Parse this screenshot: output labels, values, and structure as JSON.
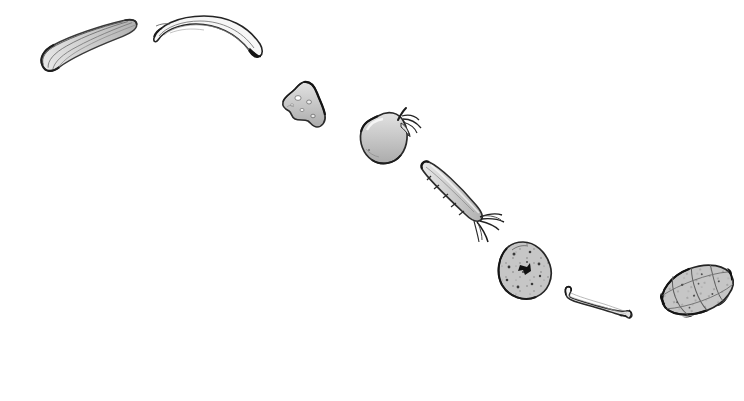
{
  "canvas": {
    "width": 744,
    "height": 401,
    "background_color": "#ffffff",
    "medium": "pen-and-ink line drawing with grey wash",
    "ink_color": "#2b2b2b",
    "wash_color": "#b9b9b9",
    "arrangement": "descending diagonal arc from upper-left to lower-right"
  },
  "items": [
    {
      "id": "zucchini",
      "label": "zucchini",
      "icon_name": "zucchini-icon",
      "order": 1,
      "x": 30,
      "y": 38,
      "width": 105,
      "height": 50,
      "rotation_deg": -13,
      "fill": "#d2d2d2",
      "stroke": "#333333",
      "notes": "elongated ridged squash, rounded blossom end at lower left"
    },
    {
      "id": "banana",
      "label": "banana",
      "icon_name": "banana-icon",
      "order": 2,
      "x": 150,
      "y": 14,
      "width": 115,
      "height": 52,
      "rotation_deg": 0,
      "fill": "#f2f2f2",
      "stroke": "#2b2b2b",
      "notes": "crescent curve, dark tip at lower right"
    },
    {
      "id": "cheese-wedge",
      "label": "cheese wedge",
      "icon_name": "cheese-wedge-icon",
      "order": 3,
      "x": 280,
      "y": 80,
      "width": 48,
      "height": 50,
      "rotation_deg": 0,
      "fill": "#cccccc",
      "stroke": "#2b2b2b",
      "notes": "triangular wedge with small round holes"
    },
    {
      "id": "apple",
      "label": "apple",
      "icon_name": "apple-icon",
      "order": 4,
      "x": 357,
      "y": 106,
      "width": 66,
      "height": 62,
      "rotation_deg": 0,
      "fill": "#c9c9c9",
      "stroke": "#2b2b2b",
      "notes": "rounded fruit with stem and leaf sprig at upper right"
    },
    {
      "id": "carrot",
      "label": "carrot",
      "icon_name": "carrot-icon",
      "order": 5,
      "x": 418,
      "y": 160,
      "width": 92,
      "height": 72,
      "rotation_deg": 0,
      "fill": "#c4c4c4",
      "stroke": "#2b2b2b",
      "notes": "tapered root pointing up-left with leafy greens at lower right"
    },
    {
      "id": "potato",
      "label": "potato",
      "icon_name": "potato-icon",
      "order": 6,
      "x": 496,
      "y": 240,
      "width": 60,
      "height": 60,
      "rotation_deg": 0,
      "fill": "#bdbdbd",
      "stroke": "#2b2b2b",
      "notes": "lumpy oval speckled with eyes, one solid dark eye near centre"
    },
    {
      "id": "bone",
      "label": "bone",
      "icon_name": "bone-icon",
      "order": 7,
      "x": 564,
      "y": 285,
      "width": 72,
      "height": 34,
      "rotation_deg": 0,
      "fill": "#f0f0f0",
      "stroke": "#2b2b2b",
      "notes": "slender shank bone, knobbed ends"
    },
    {
      "id": "melon",
      "label": "melon",
      "icon_name": "melon-icon",
      "order": 8,
      "x": 648,
      "y": 277,
      "width": 84,
      "height": 56,
      "rotation_deg": -18,
      "fill": "#b6b6b6",
      "stroke": "#2b2b2b",
      "notes": "pointed oval melon with segment ribs and speckles, dark tips"
    }
  ]
}
